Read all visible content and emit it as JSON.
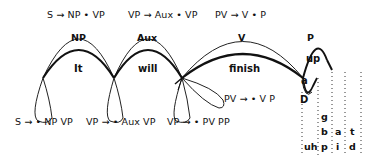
{
  "diagram": {
    "top_rules": [
      "S → NP • VP",
      "VP → Aux • VP",
      "PV → V • P"
    ],
    "categories": [
      "NP",
      "Aux",
      "V",
      "P"
    ],
    "words": [
      "It",
      "will",
      "finish",
      "up",
      "a",
      "D"
    ],
    "side_rule": "PV → • V P",
    "bottom_rules": [
      "S → • NP VP",
      "VP → • Aux VP",
      "VP → • PV PP"
    ],
    "phoneme_columns": [
      {
        "items": [
          "uh"
        ]
      },
      {
        "items": [
          "g",
          "b",
          "p"
        ]
      },
      {
        "items": [
          "a",
          "i"
        ]
      },
      {
        "items": [
          "t",
          "d"
        ]
      }
    ]
  }
}
